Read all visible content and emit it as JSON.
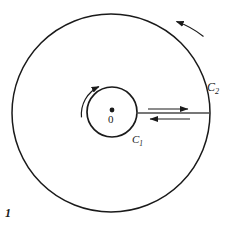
{
  "figure": {
    "caption": "1",
    "background_color": "#ffffff",
    "stroke_color": "#1a1a1a",
    "width": 231,
    "height": 229
  },
  "labels": {
    "origin": "0",
    "inner_circle": "C",
    "inner_circle_subscript": "1",
    "outer_circle": "C",
    "outer_circle_subscript": "2"
  },
  "diagram_data": {
    "type": "geometry-diagram",
    "description": "Two concentric circles with orientation arrows and a radial segment carrying opposing arrows",
    "elements": [
      {
        "name": "outer-circle",
        "shape": "circle",
        "center": [
          111,
          113
        ],
        "radius": 99,
        "label": "C2"
      },
      {
        "name": "inner-circle",
        "shape": "circle",
        "center": [
          112,
          112
        ],
        "radius": 25,
        "label": "C1"
      },
      {
        "name": "origin-dot",
        "shape": "point",
        "center": [
          112,
          110
        ],
        "radius": 2.3,
        "label": "0"
      },
      {
        "name": "radial-segment",
        "shape": "line",
        "from": [
          137,
          113
        ],
        "to": [
          210,
          113
        ]
      },
      {
        "name": "outward-arrow",
        "shape": "arrow",
        "from": [
          148,
          109
        ],
        "to": [
          190,
          109
        ],
        "direction": "right"
      },
      {
        "name": "inward-arrow",
        "shape": "arrow",
        "from": [
          190,
          119
        ],
        "to": [
          148,
          119
        ],
        "direction": "left"
      },
      {
        "name": "outer-orientation-arc",
        "shape": "arc-arrow",
        "center": [
          111,
          113
        ],
        "radius": 92,
        "start_angle_deg": -56,
        "end_angle_deg": -82,
        "direction": "counterclockwise"
      },
      {
        "name": "inner-orientation-arc",
        "shape": "arc-arrow",
        "center": [
          112,
          112
        ],
        "radius": 31,
        "start_angle_deg": 190,
        "end_angle_deg": 113,
        "direction": "counterclockwise"
      }
    ]
  }
}
